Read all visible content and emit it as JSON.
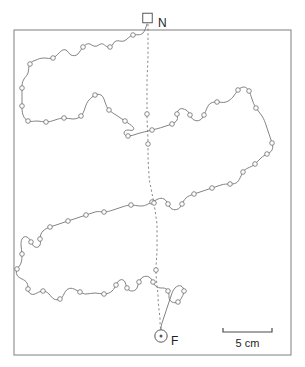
{
  "figure": {
    "type": "path-trajectory-map",
    "width": 305,
    "height": 367,
    "background_color": "#ffffff"
  },
  "frame": {
    "x": 14,
    "y": 30,
    "width": 277,
    "height": 325,
    "stroke_color": "#8a8a8a"
  },
  "labels": {
    "nest": "N",
    "food": "F"
  },
  "markers": {
    "nest": {
      "shape": "square",
      "x": 147.5,
      "y": 18.0,
      "size": 9.5
    },
    "food": {
      "shape": "circle-dot",
      "cx": 161.0,
      "cy": 336.0,
      "r": 6.2
    }
  },
  "label_positions": {
    "nest": {
      "x": 158,
      "y": 22
    },
    "food": {
      "x": 171,
      "y": 341
    }
  },
  "scalebar": {
    "label": "5 cm",
    "x1": 223,
    "x2": 272,
    "y": 332,
    "tick_height": 4,
    "label_x": 247.5,
    "label_y": 347
  },
  "chart_data": {
    "type": "scatter",
    "title": "",
    "xlabel": "",
    "ylabel": "",
    "legend": [],
    "series": [
      {
        "name": "outbound-foraging-path",
        "style": "solid",
        "color": "#6e6e6e",
        "path": "M 147,24 C 146,27 145,31 143,33 C 140,36 136,34 133,35 C 129,36 127,40 124,41 C 121,42 118,40 116,41 C 113,42 113,46 110,47 C 107,48 105,45 103,44 C 101,43 99,45 97,46 C 94,47 92,45 90,44 C 87,43 85,45 83,47 C 81,49 80,52 78,54 C 76,56 73,56 71,55 C 69,54 68,51 66,50 C 63,49 61,51 59,53 C 57,55 55,57 53,58 C 50,59 47,58 44,58 C 41,58 38,59 36,60 C 33,61 31,62 30,64 C 28,67 29,70 28,73 C 27,76 25,77 24,79 C 22,82 22,85 22,88 C 22,91 22,94 22,97 C 22,100 22,103 22,106 C 22,109 22,112 23,115 C 24,118 26,120 28,121 C 31,122 34,121 37,121 C 40,121 43,122 46,122 C 49,122 52,121 55,120 C 58,119 61,118 64,118 C 67,118 70,119 73,119 C 76,119 79,118 81,116 C 83,114 84,111 85,108 C 86,105 87,102 89,100 C 91,98 93,96 95,95 C 97,94 99,94 101,95 C 103,96 104,99 105,102 C 106,105 107,108 109,110 C 111,112 113,113 116,115 C 119,117 122,119 125,121 C 128,123 131,125 133,127 C 134,128 134,129 133,130 C 132,131 130,130 128,130 C 126,130 124,131 124,133 C 124,135 126,136 128,136 C 132,136 136,134 140,133 C 144,132 148,131 152,130 C 156,129 160,128 163,127 C 166,126 169,125 172,124 C 174,123 176,122 177,120 C 178,118 177,116 177,114 C 177,112 178,110 180,109 C 182,108 184,109 186,110 C 188,111 189,113 190,115 C 191,117 192,119 194,120 C 196,121 198,121 200,120 C 202,119 203,117 204,115 C 205,113 206,110 207,108 C 208,106 209,104 211,103 C 213,102 215,102 217,102 C 220,102 223,103 226,102 C 229,101 231,99 233,97 C 235,95 236,92 238,90 C 240,88 242,87 244,87 C 246,87 248,89 249,91 C 250,93 251,96 252,99 C 253,102 254,105 256,108 C 258,111 260,113 262,116 C 264,119 265,122 266,125 C 267,128 268,131 269,134 C 270,137 271,140 272,143 C 273,146 273,148 272,150 C 271,152 269,153 267,154 C 265,155 263,156 261,158 C 259,160 257,162 255,164 C 253,166 250,167 248,168 C 246,169 244,170 243,172 C 242,174 241,176 240,178 C 239,180 238,182 236,183 C 234,184 232,184 230,184 C 227,184 224,184 221,185 C 218,186 215,187 212,188 C 209,189 206,190 203,191 C 200,192 197,193 194,194 C 191,195 188,196 186,198 C 184,200 183,202 182,204 C 181,206 180,208 178,209 C 176,210 174,210 172,209 C 170,208 169,206 168,204 C 167,202 166,200 164,199 C 162,198 160,198 158,199 C 156,200 154,201 152,202 C 150,203 148,204 146,205 C 144,206 142,206 140,206 C 137,206 134,205 131,205 C 128,205 125,206 122,207 C 119,208 116,209 113,210 C 110,211 107,212 104,212 C 101,212 98,211 95,212 C 92,213 89,214 86,215 C 83,216 80,217 77,218 C 74,219 71,220 68,221 C 65,222 62,223 59,224 C 56,225 53,226 50,227 C 47,228 45,229 43,231 C 41,233 40,236 40,239 C 40,241 41,243 40,245 C 39,247 37,248 35,247 C 33,246 32,244 31,242 C 30,240 29,238 27,237 C 25,236 23,237 22,239 C 21,241 21,243 21,245 C 21,248 22,251 22,254 C 22,257 22,260 21,263 C 20,266 18,267 17,269 C 16,271 16,273 17,275 C 18,277 20,278 22,279 C 24,280 26,281 27,283 C 28,285 28,287 28,289 C 28,291 29,293 31,294 C 33,295 35,294 37,293 C 39,292 41,291 43,291 C 45,291 47,292 49,294 C 51,296 52,298 54,299 C 56,300 58,300 60,299 C 62,298 63,296 64,294 C 65,292 66,290 68,289 C 70,288 72,288 74,289 C 76,290 78,291 80,292 C 82,293 84,294 86,294 C 89,294 92,293 95,293 C 98,293 101,294 104,294 C 107,294 110,293 112,291 C 114,289 115,287 116,285 C 117,283 118,281 120,280 C 122,279 124,280 125,282 C 126,284 126,286 127,288 C 128,290 130,291 132,291 C 134,291 136,290 137,288 C 138,286 138,284 139,282 C 140,280 141,278 143,277 C 145,276 147,276 149,277 C 151,278 152,280 153,282 C 154,284 155,286 157,287 C 159,288 161,288 163,288 C 165,288 167,289 168,291 C 169,293 169,295 169,297 C 169,299 170,301 172,302 C 174,303 176,303 178,302 C 180,301 181,299 182,297 C 183,295 184,293 184,291 C 184,289 183,287 181,286 C 179,285 177,286 175,288 C 173,290 172,293 171,296 C 170,299 169,302 168,305 C 167,308 166,311 165,314 C 164,317 163,320 162,323 C 161,326 161,328 161,330"
      },
      {
        "name": "homing-return-vector",
        "style": "dashed",
        "color": "#7a7a7a",
        "path": "M 148,24 C 148,34 148,44 148,54 C 148,64 147,74 147,84 C 147,94 147,104 147,114 C 147,124 148,134 148,144 C 148,154 148,164 149,174 C 149,180 150,184 151,188 C 152,194 153,198 154,203 C 155,210 156,217 157,224 C 157,232 157,240 157,248 C 157,256 156,263 156,270 C 156,278 157,286 158,294 C 158,302 159,310 160,318 C 160,323 160,327 161,330"
      }
    ],
    "node_markers": {
      "description": "small open circles marking sampled positions along both paths",
      "radius": 2.3,
      "outbound": [
        [
          133,
          35
        ],
        [
          110,
          47
        ],
        [
          83,
          47
        ],
        [
          53,
          58
        ],
        [
          30,
          64
        ],
        [
          22,
          88
        ],
        [
          22,
          106
        ],
        [
          28,
          121
        ],
        [
          46,
          122
        ],
        [
          64,
          118
        ],
        [
          81,
          116
        ],
        [
          95,
          95
        ],
        [
          109,
          110
        ],
        [
          125,
          121
        ],
        [
          128,
          136
        ],
        [
          152,
          130
        ],
        [
          172,
          124
        ],
        [
          177,
          114
        ],
        [
          190,
          115
        ],
        [
          204,
          115
        ],
        [
          217,
          102
        ],
        [
          238,
          90
        ],
        [
          249,
          91
        ],
        [
          256,
          108
        ],
        [
          272,
          143
        ],
        [
          267,
          154
        ],
        [
          255,
          164
        ],
        [
          243,
          172
        ],
        [
          230,
          184
        ],
        [
          212,
          188
        ],
        [
          194,
          194
        ],
        [
          182,
          204
        ],
        [
          168,
          204
        ],
        [
          152,
          202
        ],
        [
          131,
          205
        ],
        [
          104,
          212
        ],
        [
          86,
          215
        ],
        [
          68,
          221
        ],
        [
          50,
          227
        ],
        [
          40,
          239
        ],
        [
          31,
          242
        ],
        [
          22,
          254
        ],
        [
          17,
          269
        ],
        [
          28,
          289
        ],
        [
          43,
          291
        ],
        [
          60,
          299
        ],
        [
          80,
          292
        ],
        [
          104,
          294
        ],
        [
          116,
          285
        ],
        [
          127,
          288
        ],
        [
          139,
          282
        ],
        [
          153,
          282
        ],
        [
          168,
          291
        ],
        [
          178,
          302
        ],
        [
          184,
          291
        ]
      ],
      "homing": [
        [
          147,
          114
        ],
        [
          148,
          144
        ],
        [
          154,
          203
        ],
        [
          156,
          270
        ]
      ]
    },
    "special_points": [
      {
        "label": "N",
        "role": "nest",
        "x": 147.5,
        "y": 22.0
      },
      {
        "label": "F",
        "role": "food",
        "x": 161.0,
        "y": 336.0
      }
    ],
    "annotations": [
      {
        "text": "N",
        "x": 158,
        "y": 22
      },
      {
        "text": "F",
        "x": 171,
        "y": 341
      },
      {
        "text": "5 cm",
        "x": 247.5,
        "y": 347
      }
    ],
    "scale": {
      "label": "5 cm",
      "pixel_length": 49
    },
    "grid": false,
    "axis_ranges": {
      "x": [
        14,
        291
      ],
      "y": [
        30,
        355
      ]
    }
  }
}
